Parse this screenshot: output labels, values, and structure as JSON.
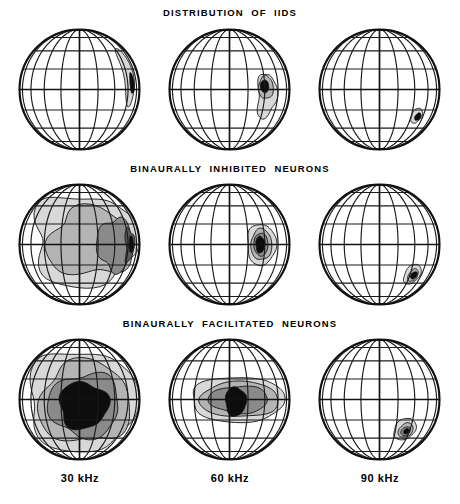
{
  "figure": {
    "kind": "spherical-receptive-field-maps",
    "rows": 3,
    "columns": 3,
    "row_titles": [
      "DISTRIBUTION  OF  IIDS",
      "BINAURALLY  INHIBITED  NEURONS",
      "BINAURALLY  FACILITATED  NEURONS"
    ],
    "column_labels": [
      "30 kHz",
      "60 kHz",
      "90 kHz"
    ],
    "globe": {
      "outline_color": "#111111",
      "grid_color": "#1a1a1a",
      "meridian_count": 11,
      "parallel_count": 9,
      "equator_emphasized": true,
      "background": "#ffffff"
    },
    "contour_levels": [
      {
        "name": "level-1",
        "fill": "#d8d8d8"
      },
      {
        "name": "level-2",
        "fill": "#b4b4b4"
      },
      {
        "name": "level-3",
        "fill": "#8a8a8a"
      },
      {
        "name": "level-4",
        "fill": "#5a5a5a"
      },
      {
        "name": "core",
        "fill": "#0d0d0d"
      }
    ]
  },
  "chart_data": {
    "type": "heatmap",
    "xlabel": "Frequency",
    "ylabel": "Measure",
    "categories": [
      "30 kHz",
      "60 kHz",
      "90 kHz"
    ],
    "series": [
      {
        "name": "DISTRIBUTION  OF  IIDS",
        "cells": [
          {
            "category": "30 kHz",
            "focus_azimuth": 42,
            "focus_elevation": 6,
            "extent": "narrow vertical band along upper-right limb",
            "levels": 2,
            "core_area_pct": 3,
            "shaded_area_pct": 9
          },
          {
            "category": "60 kHz",
            "focus_azimuth": 30,
            "focus_elevation": 2,
            "extent": "rounded patch straddling equator, tail extending down",
            "levels": 3,
            "core_area_pct": 5,
            "shaded_area_pct": 14
          },
          {
            "category": "90 kHz",
            "focus_azimuth": 33,
            "focus_elevation": -22,
            "extent": "small compact patch below equator",
            "levels": 2,
            "core_area_pct": 3,
            "shaded_area_pct": 6
          }
        ]
      },
      {
        "name": "BINAURALLY  INHIBITED  NEURONS",
        "cells": [
          {
            "category": "30 kHz",
            "focus_azimuth": 46,
            "focus_elevation": 0,
            "extent": "broad C-shaped region covering most of hemisphere",
            "levels": 4,
            "core_area_pct": 8,
            "shaded_area_pct": 48
          },
          {
            "category": "60 kHz",
            "focus_azimuth": 26,
            "focus_elevation": 0,
            "extent": "concentric ovals centred on equator",
            "levels": 4,
            "core_area_pct": 6,
            "shaded_area_pct": 18
          },
          {
            "category": "90 kHz",
            "focus_azimuth": 30,
            "focus_elevation": -25,
            "extent": "small concentric rings below equator",
            "levels": 3,
            "core_area_pct": 3,
            "shaded_area_pct": 8
          }
        ]
      },
      {
        "name": "BINAURALLY  FACILITATED  NEURONS",
        "cells": [
          {
            "category": "30 kHz",
            "focus_azimuth": 8,
            "focus_elevation": -4,
            "extent": "very large central region filling the globe",
            "levels": 4,
            "core_area_pct": 22,
            "shaded_area_pct": 66
          },
          {
            "category": "60 kHz",
            "focus_azimuth": 10,
            "focus_elevation": 0,
            "extent": "horizontally elongated lens with teardrop core",
            "levels": 4,
            "core_area_pct": 10,
            "shaded_area_pct": 38
          },
          {
            "category": "90 kHz",
            "focus_azimuth": 22,
            "focus_elevation": -26,
            "extent": "tight concentric rings below equator",
            "levels": 4,
            "core_area_pct": 3,
            "shaded_area_pct": 10
          }
        ]
      }
    ],
    "grid": true,
    "legend_position": "none"
  }
}
